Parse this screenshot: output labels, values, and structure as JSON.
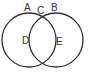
{
  "diagram": {
    "type": "venn",
    "circles": [
      {
        "name": "left",
        "cx": 29,
        "cy": 40,
        "r": 27
      },
      {
        "name": "right",
        "cx": 56,
        "cy": 40,
        "r": 27
      }
    ],
    "stroke_color": "#333333",
    "labels": {
      "A": "A",
      "B": "B",
      "C": "C",
      "D": "D",
      "E": "E"
    }
  }
}
